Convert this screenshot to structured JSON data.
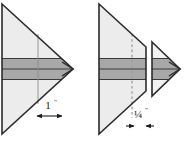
{
  "figure": {
    "type": "technical-line-diagram",
    "canvas": {
      "width": 187,
      "height": 145
    },
    "background_color": "#ffffff"
  },
  "palette": {
    "paper_white": "#ffffff",
    "body_fill": "#ececec",
    "body_fill_light": "#f2f2f2",
    "band_fill": "#a8a8a8",
    "band_fill_dark": "#9a9a9a",
    "outline": "#2b2b2b",
    "rule_line": "#3a3a3a",
    "thin_line": "#8c8c8c",
    "dashed_line": "#9e9e9e",
    "text": "#1a1a1a"
  },
  "panels": [
    {
      "id": "left-panel",
      "name": "unsplit-point",
      "shape": "left-pointing-triangle-rotated-right",
      "description": "Solid triangular point with horizontal core band running to the tip",
      "apex_position": "right",
      "has_vertical_cut": false,
      "guide_line": {
        "orientation": "vertical",
        "style": "thin-solid",
        "purpose": "marks the 1 inch setback from the tip"
      },
      "dimension": {
        "name": "setback-dimension",
        "value": "1",
        "unit_symbol": "\"",
        "display": "1\"",
        "arrow_style": "double-headed-outward",
        "placement": "below-figure"
      }
    },
    {
      "id": "right-panel",
      "name": "split-point",
      "shape": "left-pointing-triangle-rotated-right",
      "description": "Same triangular point cut vertically; the tip section is shifted right leaving a gap",
      "apex_position": "right",
      "has_vertical_cut": true,
      "cut_line": {
        "orientation": "vertical",
        "style": "solid",
        "purpose": "cut edge of the main body"
      },
      "guide_line": {
        "orientation": "vertical",
        "style": "dashed",
        "purpose": "original position reference line"
      },
      "tip_piece": {
        "name": "detached-tip",
        "offset_direction": "right",
        "retains_band": true
      },
      "dimension": {
        "name": "gap-dimension",
        "value": "¼",
        "unit_symbol": "\"",
        "display": "¼\"",
        "arrow_style": "double-headed-inward",
        "placement": "below-figure"
      }
    }
  ],
  "core_band": {
    "name": "horizontal-core-band",
    "orientation": "horizontal",
    "fill_color": "#a8a8a8",
    "rule_count": 3,
    "terminates_in_arrow_tip": true,
    "description": "Banded core layer running horizontally through the full width of each point, ending in a small arrow tip"
  }
}
